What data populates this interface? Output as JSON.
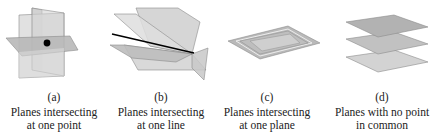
{
  "figure": {
    "panels": [
      {
        "id": "a",
        "label": "(a)",
        "caption_line1": "Planes intersecting",
        "caption_line2": "at one point",
        "depiction": "three-planes-meeting-at-point"
      },
      {
        "id": "b",
        "label": "(b)",
        "caption_line1": "Planes intersecting",
        "caption_line2": "at one line",
        "depiction": "three-planes-meeting-along-line"
      },
      {
        "id": "c",
        "label": "(c)",
        "caption_line1": "Planes intersecting",
        "caption_line2": "at one plane",
        "depiction": "coincident-planes"
      },
      {
        "id": "d",
        "label": "(d)",
        "caption_line1": "Planes with no point",
        "caption_line2": "in common",
        "depiction": "three-parallel-planes"
      }
    ],
    "colors": {
      "plane_light": "#d9d9d9",
      "plane_mid": "#c4c4c4",
      "plane_dark": "#b3b3b3",
      "edge": "#8c8c8c",
      "intersection": "#000000"
    }
  }
}
